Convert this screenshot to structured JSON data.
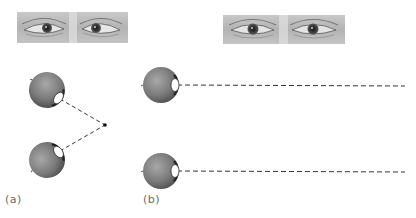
{
  "figure": {
    "panels": [
      {
        "id": "a",
        "label": "(a)",
        "description": "Converging gaze: both eyes fixate a near point",
        "photo": {
          "x": 17,
          "y": 12,
          "w": 111,
          "h": 31,
          "gaze": "converged"
        },
        "eyes": [
          {
            "cx": 47,
            "cy": 90,
            "r": 18,
            "lens_angle_deg": 35
          },
          {
            "cx": 47,
            "cy": 160,
            "r": 18,
            "lens_angle_deg": -35
          }
        ],
        "fixation_point": {
          "x": 105,
          "y": 125
        }
      },
      {
        "id": "b",
        "label": "(b)",
        "description": "Parallel gaze: both eyes look at a distant point",
        "photo": {
          "x": 223,
          "y": 15,
          "w": 122,
          "h": 29,
          "gaze": "parallel"
        },
        "eyes": [
          {
            "cx": 161,
            "cy": 85,
            "r": 18,
            "lens_angle_deg": 0
          },
          {
            "cx": 161,
            "cy": 171,
            "r": 18,
            "lens_angle_deg": 0
          }
        ],
        "line_end_x": 405
      }
    ],
    "colors": {
      "eyeball": "#7a7a7a",
      "eyeball_highlight": "#a8a8a8",
      "eyeball_shadow": "#4a4a4a",
      "dash": "#333333",
      "label": "#6a6a6a",
      "photo_bg": "#b9b9b9"
    }
  }
}
